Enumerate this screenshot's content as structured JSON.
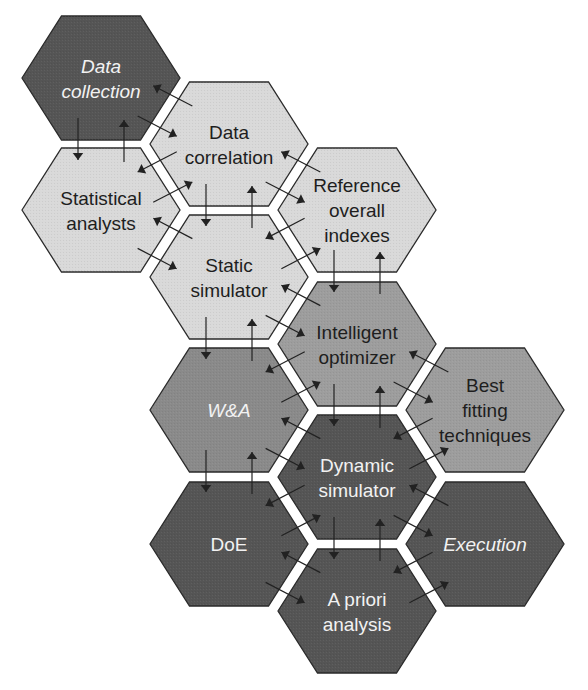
{
  "colors": {
    "dark": "#555555",
    "medium": "#8a8a8a",
    "mid_light": "#9d9d9d",
    "light": "#d9d9d9",
    "outline": "#2a2a2a",
    "arrow": "#222222",
    "text_dark": "#1e1e1e",
    "text_light": "#f2f2f2"
  },
  "hexagons": [
    {
      "id": "data-collection",
      "lines": [
        "Data",
        "collection"
      ],
      "italic": true,
      "shade": "dark",
      "cx": 101,
      "cy": 78
    },
    {
      "id": "data-correlation",
      "lines": [
        "Data",
        "correlation"
      ],
      "italic": false,
      "shade": "light",
      "cx": 229,
      "cy": 144
    },
    {
      "id": "statistical-analysts",
      "lines": [
        "Statistical",
        "analysts"
      ],
      "italic": false,
      "shade": "light",
      "cx": 101,
      "cy": 210
    },
    {
      "id": "reference-overall-indexes",
      "lines": [
        "Reference",
        "overall",
        "indexes"
      ],
      "italic": false,
      "shade": "light",
      "cx": 357,
      "cy": 210
    },
    {
      "id": "static-simulator",
      "lines": [
        "Static",
        "simulator"
      ],
      "italic": false,
      "shade": "light",
      "cx": 229,
      "cy": 277
    },
    {
      "id": "intelligent-optimizer",
      "lines": [
        "Intelligent",
        "optimizer"
      ],
      "italic": false,
      "shade": "mid_light",
      "cx": 357,
      "cy": 344
    },
    {
      "id": "w-and-a",
      "lines": [
        "W&A"
      ],
      "italic": true,
      "shade": "medium",
      "cx": 229,
      "cy": 410
    },
    {
      "id": "best-fitting-techniques",
      "lines": [
        "Best",
        "fitting",
        "techniques"
      ],
      "italic": false,
      "shade": "mid_light",
      "cx": 485,
      "cy": 410
    },
    {
      "id": "dynamic-simulator",
      "lines": [
        "Dynamic",
        "simulator"
      ],
      "italic": false,
      "shade": "dark",
      "cx": 357,
      "cy": 477
    },
    {
      "id": "doe",
      "lines": [
        "DoE"
      ],
      "italic": false,
      "shade": "dark",
      "cx": 229,
      "cy": 544
    },
    {
      "id": "execution",
      "lines": [
        "Execution"
      ],
      "italic": true,
      "shade": "dark",
      "cx": 485,
      "cy": 544
    },
    {
      "id": "a-priori-analysis",
      "lines": [
        "A priori",
        "analysis"
      ],
      "italic": false,
      "shade": "dark",
      "cx": 357,
      "cy": 611
    }
  ],
  "links": [
    [
      "data-collection",
      "statistical-analysts",
      "v"
    ],
    [
      "data-collection",
      "data-correlation",
      "d"
    ],
    [
      "data-correlation",
      "statistical-analysts",
      "d"
    ],
    [
      "data-correlation",
      "static-simulator",
      "v"
    ],
    [
      "data-correlation",
      "reference-overall-indexes",
      "d"
    ],
    [
      "statistical-analysts",
      "static-simulator",
      "d"
    ],
    [
      "reference-overall-indexes",
      "static-simulator",
      "d"
    ],
    [
      "reference-overall-indexes",
      "intelligent-optimizer",
      "v"
    ],
    [
      "static-simulator",
      "intelligent-optimizer",
      "d"
    ],
    [
      "static-simulator",
      "w-and-a",
      "v"
    ],
    [
      "intelligent-optimizer",
      "w-and-a",
      "d"
    ],
    [
      "intelligent-optimizer",
      "best-fitting-techniques",
      "d"
    ],
    [
      "intelligent-optimizer",
      "dynamic-simulator",
      "v"
    ],
    [
      "w-and-a",
      "dynamic-simulator",
      "d"
    ],
    [
      "w-and-a",
      "doe",
      "v"
    ],
    [
      "best-fitting-techniques",
      "dynamic-simulator",
      "d"
    ],
    [
      "dynamic-simulator",
      "doe",
      "d"
    ],
    [
      "dynamic-simulator",
      "execution",
      "d"
    ],
    [
      "dynamic-simulator",
      "a-priori-analysis",
      "v"
    ],
    [
      "doe",
      "a-priori-analysis",
      "d"
    ],
    [
      "execution",
      "a-priori-analysis",
      "d"
    ]
  ]
}
